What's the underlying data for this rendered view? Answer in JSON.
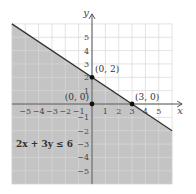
{
  "chart_data": {
    "type": "line",
    "title": "",
    "xlabel": "x",
    "ylabel": "y",
    "xlim": [
      -6,
      6
    ],
    "ylim": [
      -6,
      6
    ],
    "grid": true,
    "x_ticks": [
      -5,
      -4,
      -3,
      -2,
      -1,
      1,
      2,
      3,
      4,
      5
    ],
    "y_ticks": [
      -5,
      -4,
      -3,
      -2,
      -1,
      1,
      2,
      3,
      4,
      5
    ],
    "x_tick_labels": [
      "−5",
      "−4",
      "−3",
      "−2",
      "−1",
      "1",
      "2",
      "3",
      "4",
      "5"
    ],
    "y_tick_labels": [
      "−5",
      "−4",
      "−3",
      "−2",
      "−1",
      "1",
      "2",
      "3",
      "4",
      "5"
    ],
    "boundary_line": {
      "equation": "2x + 3y = 6",
      "x": [
        -6,
        6
      ],
      "y": [
        6,
        -2
      ],
      "style": "solid"
    },
    "shaded_region": "below line (2x + 3y ≤ 6)",
    "points": [
      {
        "x": 0,
        "y": 2,
        "label": "(0, 2)"
      },
      {
        "x": 0,
        "y": 0,
        "label": "(0, 0)"
      },
      {
        "x": 3,
        "y": 0,
        "label": "(3, 0)"
      }
    ],
    "annotations": [
      {
        "text": "2x + 3y ≤ 6",
        "x": -4.5,
        "y": -3
      }
    ],
    "colors": {
      "shade": "#c4c4c4",
      "grid_unshaded": "#dcdcdc",
      "grid_shaded": "#d6d6d6",
      "axis": "#555555",
      "line": "#333333",
      "point": "#111111"
    }
  },
  "labels": {
    "x_axis": "x",
    "y_axis": "y",
    "point_0_2": "(0, 2)",
    "point_0_0": "(0, 0)",
    "point_3_0": "(3, 0)",
    "inequality": "2x + 3y ≤ 6"
  }
}
